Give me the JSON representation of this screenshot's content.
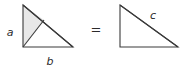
{
  "figure": {
    "background_color": "#ffffff",
    "stroke_color": "#3a3a3a",
    "shade_color": "#e6e6e6",
    "text_color": "#2b2b2b",
    "relation_symbol": "=",
    "left_shape": {
      "name": "subdivided-right-triangle",
      "labels": {
        "vertical_leg": "a",
        "horizontal_leg": "b"
      },
      "vertices": {
        "top": [
          23,
          5
        ],
        "bottom_left": [
          23,
          47
        ],
        "bottom_right": [
          73,
          47
        ]
      },
      "interior_point": [
        44,
        20
      ],
      "shaded_region": [
        [
          23,
          5
        ],
        [
          44,
          20
        ],
        [
          23,
          47
        ]
      ]
    },
    "right_shape": {
      "name": "plain-right-triangle",
      "labels": {
        "hypotenuse": "c"
      },
      "vertices": {
        "top": [
          120,
          5
        ],
        "bottom_left": [
          120,
          47
        ],
        "bottom_right": [
          178,
          47
        ]
      }
    }
  }
}
